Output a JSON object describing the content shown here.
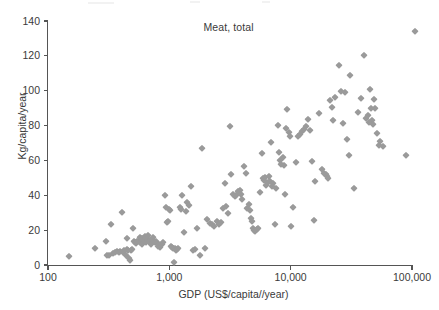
{
  "chart_data": {
    "type": "scatter",
    "title": "Meat, total",
    "xlabel": "GDP (US$/capita//year)",
    "ylabel": "Kg/capita/year",
    "xscale": "log",
    "yscale": "linear",
    "xlim": [
      100,
      100000
    ],
    "ylim": [
      0,
      140
    ],
    "grid": false,
    "legend": null,
    "marker": {
      "shape": "diamond",
      "color": "#9a9a9a",
      "size_px": 4.6
    },
    "xticks": [
      100,
      1000,
      10000,
      100000
    ],
    "xtick_labels": [
      "100",
      "1,000",
      "10,000",
      "100,000"
    ],
    "yticks": [
      0,
      20,
      40,
      60,
      80,
      100,
      120,
      140
    ],
    "ytick_labels": [
      "0",
      "20",
      "40",
      "60",
      "80",
      "100",
      "120",
      "140"
    ],
    "series": [
      {
        "name": "Countries",
        "points": [
          [
            150,
            5
          ],
          [
            243,
            9.5
          ],
          [
            300,
            13.5
          ],
          [
            305,
            6
          ],
          [
            320,
            5.5
          ],
          [
            330,
            23.5
          ],
          [
            345,
            7
          ],
          [
            360,
            7.5
          ],
          [
            372,
            8
          ],
          [
            385,
            7.5
          ],
          [
            395,
            8
          ],
          [
            410,
            30.5
          ],
          [
            415,
            7.5
          ],
          [
            425,
            8.5
          ],
          [
            437,
            6
          ],
          [
            448,
            15.5
          ],
          [
            452,
            9
          ],
          [
            460,
            8.5
          ],
          [
            468,
            4
          ],
          [
            475,
            3
          ],
          [
            482,
            8.5
          ],
          [
            495,
            9
          ],
          [
            505,
            21
          ],
          [
            512,
            14
          ],
          [
            520,
            13
          ],
          [
            532,
            12.5
          ],
          [
            545,
            13.5
          ],
          [
            556,
            14
          ],
          [
            568,
            13
          ],
          [
            578,
            16
          ],
          [
            590,
            12
          ],
          [
            600,
            15.5
          ],
          [
            615,
            14.5
          ],
          [
            628,
            16.5
          ],
          [
            640,
            13
          ],
          [
            655,
            15.5
          ],
          [
            668,
            17
          ],
          [
            680,
            13.5
          ],
          [
            695,
            14.5
          ],
          [
            710,
            12
          ],
          [
            730,
            16
          ],
          [
            750,
            14
          ],
          [
            765,
            13
          ],
          [
            782,
            13.5
          ],
          [
            800,
            11
          ],
          [
            825,
            12
          ],
          [
            845,
            10.5
          ],
          [
            870,
            12
          ],
          [
            895,
            13
          ],
          [
            920,
            40
          ],
          [
            940,
            33
          ],
          [
            960,
            24.5
          ],
          [
            980,
            25
          ],
          [
            1000,
            32
          ],
          [
            1010,
            31.5
          ],
          [
            1030,
            11
          ],
          [
            1050,
            10.5
          ],
          [
            1070,
            9.5
          ],
          [
            1090,
            2
          ],
          [
            1110,
            10
          ],
          [
            1130,
            8.5
          ],
          [
            1160,
            9
          ],
          [
            1190,
            9.5
          ],
          [
            1220,
            33
          ],
          [
            1250,
            32
          ],
          [
            1280,
            40
          ],
          [
            1320,
            19
          ],
          [
            1360,
            31
          ],
          [
            1400,
            36
          ],
          [
            1450,
            34.5
          ],
          [
            1500,
            45.5
          ],
          [
            1560,
            8.5
          ],
          [
            1620,
            9
          ],
          [
            1700,
            21
          ],
          [
            1780,
            6
          ],
          [
            1850,
            67
          ],
          [
            1950,
            9.5
          ],
          [
            2050,
            26.5
          ],
          [
            2150,
            24
          ],
          [
            2250,
            23.5
          ],
          [
            2350,
            22.5
          ],
          [
            2450,
            25
          ],
          [
            2550,
            23.5
          ],
          [
            2650,
            24.5
          ],
          [
            2750,
            32.5
          ],
          [
            2850,
            47
          ],
          [
            2950,
            34
          ],
          [
            3050,
            30
          ],
          [
            3150,
            80
          ],
          [
            3250,
            52
          ],
          [
            3350,
            41
          ],
          [
            3450,
            39.5
          ],
          [
            3550,
            40
          ],
          [
            3700,
            42.5
          ],
          [
            3800,
            43
          ],
          [
            3900,
            41
          ],
          [
            4000,
            38
          ],
          [
            4150,
            57
          ],
          [
            4250,
            53
          ],
          [
            4400,
            32.5
          ],
          [
            4500,
            35
          ],
          [
            4600,
            31.5
          ],
          [
            4700,
            27
          ],
          [
            4800,
            25
          ],
          [
            4900,
            21
          ],
          [
            5000,
            20
          ],
          [
            5100,
            19.5
          ],
          [
            5250,
            20.5
          ],
          [
            5400,
            21
          ],
          [
            5600,
            42
          ],
          [
            5750,
            64
          ],
          [
            5900,
            50
          ],
          [
            6000,
            49
          ],
          [
            6150,
            50.5
          ],
          [
            6300,
            46
          ],
          [
            6450,
            47.5
          ],
          [
            6600,
            51
          ],
          [
            6750,
            48
          ],
          [
            6900,
            70.5
          ],
          [
            7050,
            45.5
          ],
          [
            7200,
            47
          ],
          [
            7400,
            23.5
          ],
          [
            7600,
            44
          ],
          [
            7800,
            80.5
          ],
          [
            8000,
            65
          ],
          [
            8200,
            60.5
          ],
          [
            8400,
            58
          ],
          [
            8600,
            62
          ],
          [
            8800,
            57.5
          ],
          [
            9000,
            41
          ],
          [
            9200,
            78.5
          ],
          [
            9400,
            89.5
          ],
          [
            9600,
            76.5
          ],
          [
            9800,
            74
          ],
          [
            10000,
            22.5
          ],
          [
            10500,
            33
          ],
          [
            11000,
            59
          ],
          [
            11500,
            74
          ],
          [
            12000,
            75
          ],
          [
            12500,
            77
          ],
          [
            13000,
            78
          ],
          [
            13500,
            80
          ],
          [
            14000,
            83.5
          ],
          [
            14500,
            77.5
          ],
          [
            15000,
            59.5
          ],
          [
            15500,
            26
          ],
          [
            16000,
            48
          ],
          [
            17000,
            87.5
          ],
          [
            18000,
            55
          ],
          [
            19000,
            53
          ],
          [
            19500,
            52
          ],
          [
            20000,
            51
          ],
          [
            20500,
            50
          ],
          [
            21000,
            94.5
          ],
          [
            22000,
            90.5
          ],
          [
            22500,
            83
          ],
          [
            23000,
            96.5
          ],
          [
            25000,
            114.5
          ],
          [
            26000,
            100
          ],
          [
            27000,
            81.5
          ],
          [
            28000,
            99.5
          ],
          [
            29000,
            72.5
          ],
          [
            30000,
            63
          ],
          [
            31000,
            109
          ],
          [
            33000,
            44
          ],
          [
            36000,
            88
          ],
          [
            38000,
            96
          ],
          [
            40000,
            120.5
          ],
          [
            42000,
            84.5
          ],
          [
            43000,
            86
          ],
          [
            44000,
            82
          ],
          [
            45000,
            101
          ],
          [
            46000,
            90
          ],
          [
            47000,
            83
          ],
          [
            48000,
            81
          ],
          [
            49000,
            95.5
          ],
          [
            50000,
            90
          ],
          [
            51000,
            76
          ],
          [
            53000,
            69
          ],
          [
            55000,
            71
          ],
          [
            58000,
            68.5
          ],
          [
            90000,
            63
          ],
          [
            105000,
            134
          ]
        ]
      }
    ]
  },
  "axis": {
    "x_tick_labels": [
      "100",
      "1,000",
      "10,000",
      "100,000"
    ],
    "y_tick_labels": [
      "0",
      "20",
      "40",
      "60",
      "80",
      "100",
      "120",
      "140"
    ]
  }
}
